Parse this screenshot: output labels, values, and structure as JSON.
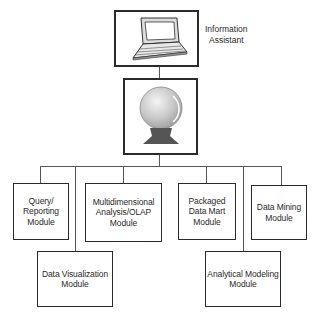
{
  "top": {
    "laptop_label": "Information\nAssistant",
    "laptop_icon": "laptop-icon",
    "crystal_ball_icon": "crystal-ball-icon"
  },
  "modules": [
    {
      "id": "query",
      "label": "Query/\nReporting\nModule"
    },
    {
      "id": "multidim",
      "label": "Multidimensional\nAnalysis/OLAP\nModule"
    },
    {
      "id": "packaged",
      "label": "Packaged\nData Mart\nModule"
    },
    {
      "id": "mining",
      "label": "Data Mining\nModule"
    },
    {
      "id": "visualization",
      "label": "Data Visualization\nModule"
    },
    {
      "id": "analytical",
      "label": "Analytical Modeling\nModule"
    }
  ],
  "colors": {
    "line": "#2a2a2a",
    "ball": "#c8c8c8",
    "stand": "#555555"
  }
}
